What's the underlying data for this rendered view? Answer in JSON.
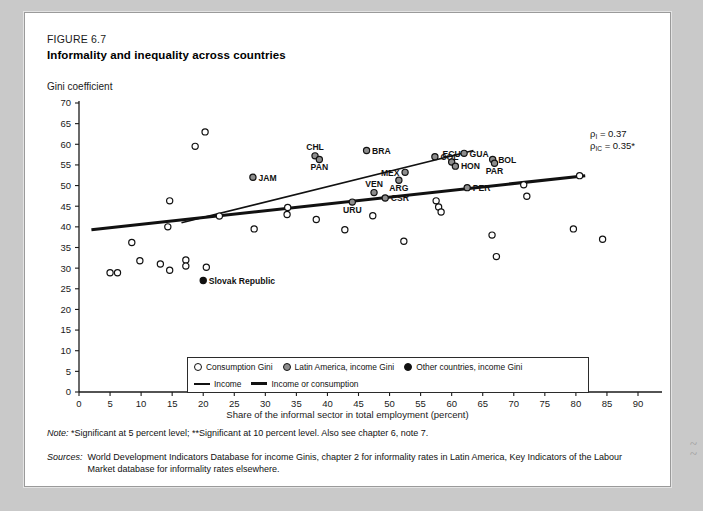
{
  "figure": {
    "number_label": "FIGURE 6.7",
    "title": "Informality and inequality across countries",
    "ylabel": "Gini coefficient",
    "xlabel": "Share of the informal sector in total employment (percent)"
  },
  "annotations": {
    "rho_income": {
      "symbol": "ρ",
      "sub": "I",
      "text": " = 0.37"
    },
    "rho_income_consumption": {
      "symbol": "ρ",
      "sub": "IC",
      "text": " = 0.35*"
    }
  },
  "legend": {
    "items": [
      {
        "marker": "open-circle",
        "label": "Consumption Gini"
      },
      {
        "marker": "grey-circle",
        "label": "Latin America, income Gini"
      },
      {
        "marker": "filled-circle",
        "label": "Other countries, income Gini"
      },
      {
        "marker": "thin-line",
        "label": "Income"
      },
      {
        "marker": "thick-line",
        "label": "Income or consumption"
      }
    ]
  },
  "note": {
    "prefix": "Note:",
    "text": "*Significant at 5 percent level; **Significant at 10 percent level. Also see chapter 6, note 7."
  },
  "sources": {
    "prefix": "Sources:",
    "text": "World Development Indicators Database for income Ginis, chapter 2 for informality rates  in Latin America, Key Indicators of the Labour Market database for informality rates elsewhere."
  },
  "chart_data": {
    "type": "scatter",
    "title": "Informality and inequality across countries",
    "xlabel": "Share of the informal sector in total employment (percent)",
    "ylabel": "Gini coefficient",
    "xlim": [
      0,
      90
    ],
    "ylim": [
      0,
      70
    ],
    "xticks": [
      0,
      5,
      10,
      15,
      20,
      25,
      30,
      35,
      40,
      45,
      50,
      55,
      60,
      65,
      70,
      75,
      80,
      85,
      90
    ],
    "yticks": [
      0,
      5,
      10,
      15,
      20,
      25,
      30,
      35,
      40,
      45,
      50,
      55,
      60,
      65,
      70
    ],
    "grid": false,
    "legend_position": "bottom-center",
    "series": [
      {
        "name": "Latin America, income Gini",
        "marker": "grey-circle",
        "points": [
          {
            "label": "JAM",
            "x": 28.0,
            "y": 52.0,
            "label_pos": "right"
          },
          {
            "label": "CHL",
            "x": 38.0,
            "y": 57.2,
            "label_pos": "above"
          },
          {
            "label": "PAN",
            "x": 38.7,
            "y": 56.3,
            "label_pos": "below"
          },
          {
            "label": "BRA",
            "x": 46.3,
            "y": 58.5,
            "label_pos": "right"
          },
          {
            "label": "VEN",
            "x": 47.5,
            "y": 48.3,
            "label_pos": "above"
          },
          {
            "label": "CSR",
            "x": 49.3,
            "y": 47.0,
            "label_pos": "right"
          },
          {
            "label": "ARG",
            "x": 51.5,
            "y": 51.3,
            "label_pos": "below"
          },
          {
            "label": "MEX",
            "x": 52.5,
            "y": 53.2,
            "label_pos": "left"
          },
          {
            "label": "COL",
            "x": 57.3,
            "y": 57.0,
            "label_pos": "right"
          },
          {
            "label": "ECU",
            "x": 60.0,
            "y": 55.7,
            "label_pos": "above"
          },
          {
            "label": "HON",
            "x": 60.6,
            "y": 54.7,
            "label_pos": "right"
          },
          {
            "label": "GUA",
            "x": 62.0,
            "y": 57.8,
            "label_pos": "right"
          },
          {
            "label": "PER",
            "x": 62.5,
            "y": 49.5,
            "label_pos": "right"
          },
          {
            "label": "BOL",
            "x": 66.6,
            "y": 56.3,
            "label_pos": "right"
          },
          {
            "label": "PAR",
            "x": 66.9,
            "y": 55.4,
            "label_pos": "below"
          },
          {
            "label": "URU",
            "x": 44.0,
            "y": 46.0,
            "label_pos": "below"
          }
        ]
      },
      {
        "name": "Consumption Gini",
        "marker": "open-circle",
        "points": [
          {
            "x": 5.0,
            "y": 28.9
          },
          {
            "x": 6.2,
            "y": 28.9
          },
          {
            "x": 8.5,
            "y": 36.2
          },
          {
            "x": 9.8,
            "y": 31.8
          },
          {
            "x": 13.1,
            "y": 31.0
          },
          {
            "x": 14.6,
            "y": 29.5
          },
          {
            "x": 14.3,
            "y": 40.0
          },
          {
            "x": 14.6,
            "y": 46.3
          },
          {
            "x": 17.2,
            "y": 32.0
          },
          {
            "x": 17.2,
            "y": 30.5
          },
          {
            "x": 18.7,
            "y": 59.5
          },
          {
            "x": 20.3,
            "y": 63.0
          },
          {
            "x": 20.5,
            "y": 30.2
          },
          {
            "x": 22.6,
            "y": 42.6
          },
          {
            "x": 28.2,
            "y": 39.5
          },
          {
            "x": 33.5,
            "y": 43.0
          },
          {
            "x": 33.6,
            "y": 44.7
          },
          {
            "x": 38.2,
            "y": 41.8
          },
          {
            "x": 42.8,
            "y": 39.3
          },
          {
            "x": 47.3,
            "y": 42.7
          },
          {
            "x": 52.3,
            "y": 36.5
          },
          {
            "x": 57.5,
            "y": 46.3
          },
          {
            "x": 57.9,
            "y": 44.8
          },
          {
            "x": 58.3,
            "y": 43.6
          },
          {
            "x": 66.5,
            "y": 38.0
          },
          {
            "x": 67.2,
            "y": 32.8
          },
          {
            "x": 71.6,
            "y": 50.2
          },
          {
            "x": 72.1,
            "y": 47.4
          },
          {
            "x": 79.6,
            "y": 39.5
          },
          {
            "x": 80.6,
            "y": 52.4
          },
          {
            "x": 84.3,
            "y": 37.0
          }
        ]
      },
      {
        "name": "Other countries, income Gini",
        "marker": "filled-circle",
        "points": [
          {
            "label": "Slovak Republic",
            "x": 20.0,
            "y": 27.0,
            "label_pos": "right"
          }
        ]
      }
    ],
    "trendlines": [
      {
        "name": "Income",
        "style": "thin",
        "x0": 16.5,
        "y0": 41.0,
        "x1": 63.5,
        "y1": 58.5
      },
      {
        "name": "Income or consumption",
        "style": "thick",
        "x0": 2.0,
        "y0": 39.3,
        "x1": 81.5,
        "y1": 52.4
      }
    ]
  }
}
